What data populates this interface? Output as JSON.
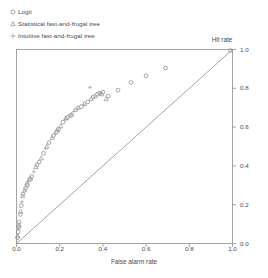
{
  "chart_data": {
    "type": "scatter",
    "title": "",
    "xlabel": "False alarm rate",
    "ylabel": "Hit rate",
    "xlim": [
      0,
      1
    ],
    "ylim": [
      0,
      1
    ],
    "grid": false,
    "y_axis_position": "right",
    "xticks": [
      "0.0",
      "0.2",
      "0.4",
      "0.6",
      "0.8",
      "1.0"
    ],
    "xtick_values": [
      0.0,
      0.2,
      0.4,
      0.6,
      0.8,
      1.0
    ],
    "yticks": [
      "0.0",
      "0.2",
      "0.4",
      "0.6",
      "0.8",
      "1.0"
    ],
    "ytick_values": [
      0.0,
      0.2,
      0.4,
      0.6,
      0.8,
      1.0
    ],
    "legend_position": "above-plot-left",
    "reference_line": {
      "name": "chance diagonal",
      "from": [
        0.0,
        0.0
      ],
      "to": [
        1.0,
        1.0
      ],
      "color": "#8d8d8d"
    },
    "series": [
      {
        "name": "Logit",
        "marker": "circle",
        "color": "#8a8a8a",
        "points": [
          [
            0.005,
            0.03
          ],
          [
            0.008,
            0.06
          ],
          [
            0.01,
            0.085
          ],
          [
            0.012,
            0.11
          ],
          [
            0.018,
            0.15
          ],
          [
            0.022,
            0.195
          ],
          [
            0.03,
            0.255
          ],
          [
            0.042,
            0.285
          ],
          [
            0.05,
            0.3
          ],
          [
            0.06,
            0.33
          ],
          [
            0.07,
            0.345
          ],
          [
            0.095,
            0.405
          ],
          [
            0.105,
            0.42
          ],
          [
            0.125,
            0.465
          ],
          [
            0.15,
            0.52
          ],
          [
            0.17,
            0.555
          ],
          [
            0.185,
            0.575
          ],
          [
            0.195,
            0.59
          ],
          [
            0.215,
            0.625
          ],
          [
            0.235,
            0.65
          ],
          [
            0.25,
            0.66
          ],
          [
            0.275,
            0.69
          ],
          [
            0.3,
            0.705
          ],
          [
            0.33,
            0.73
          ],
          [
            0.355,
            0.755
          ],
          [
            0.375,
            0.77
          ],
          [
            0.385,
            0.775
          ],
          [
            0.4,
            0.78
          ],
          [
            0.425,
            0.76
          ],
          [
            0.47,
            0.79
          ],
          [
            0.53,
            0.83
          ],
          [
            0.6,
            0.865
          ],
          [
            0.69,
            0.905
          ],
          [
            0.99,
            0.995
          ]
        ]
      },
      {
        "name": "Statistical fast-and-frugal tree",
        "marker": "triangle",
        "color": "#9a9a9a",
        "points": [
          [
            0.006,
            0.04
          ],
          [
            0.012,
            0.095
          ],
          [
            0.02,
            0.165
          ],
          [
            0.028,
            0.245
          ],
          [
            0.038,
            0.275
          ],
          [
            0.048,
            0.31
          ],
          [
            0.065,
            0.335
          ],
          [
            0.09,
            0.395
          ],
          [
            0.115,
            0.44
          ],
          [
            0.14,
            0.5
          ],
          [
            0.165,
            0.545
          ],
          [
            0.19,
            0.585
          ],
          [
            0.205,
            0.605
          ],
          [
            0.23,
            0.645
          ],
          [
            0.255,
            0.665
          ],
          [
            0.285,
            0.7
          ],
          [
            0.315,
            0.72
          ],
          [
            0.345,
            0.745
          ],
          [
            0.365,
            0.76
          ],
          [
            0.395,
            0.77
          ],
          [
            0.415,
            0.745
          ]
        ]
      },
      {
        "name": "Intuitive fast-and-frugal tree",
        "marker": "plus",
        "color": "#a5a5a5",
        "points": [
          [
            0.01,
            0.075
          ],
          [
            0.025,
            0.215
          ],
          [
            0.055,
            0.32
          ],
          [
            0.08,
            0.37
          ],
          [
            0.135,
            0.49
          ],
          [
            0.18,
            0.565
          ],
          [
            0.225,
            0.64
          ],
          [
            0.265,
            0.68
          ],
          [
            0.31,
            0.715
          ],
          [
            0.34,
            0.805
          ],
          [
            0.39,
            0.775
          ]
        ]
      }
    ]
  },
  "legend": {
    "items": [
      {
        "label": "Logit",
        "marker": "circle-marker-icon"
      },
      {
        "label": "Statistical fast-and-frugal tree",
        "marker": "triangle-marker-icon"
      },
      {
        "label": "Intuitive fast-and-frugal tree",
        "marker": "plus-marker-icon"
      }
    ]
  },
  "axes": {
    "x_label": "False alarm rate",
    "y_label": "Hit rate"
  }
}
